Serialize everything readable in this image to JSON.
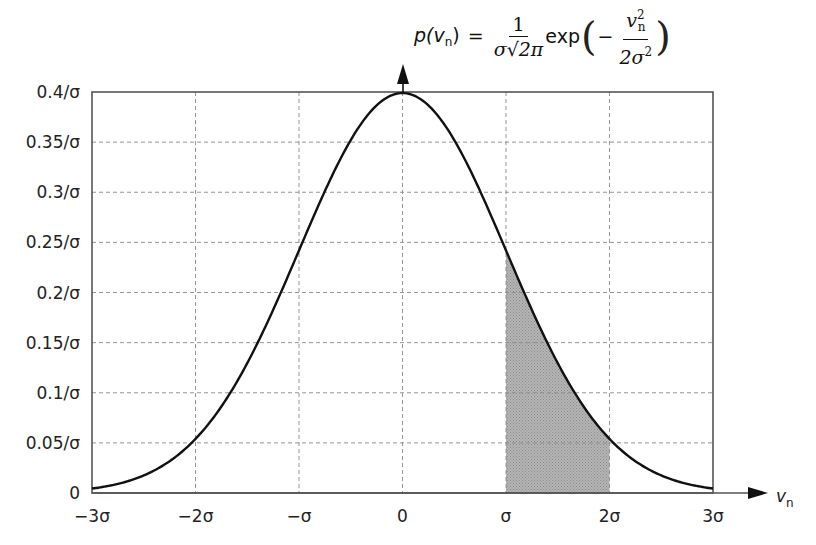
{
  "chart_data": {
    "type": "line",
    "formula": {
      "lhs": "p(v",
      "lhs_sub": "n",
      "lhs_close": ")",
      "equals": "=",
      "frac1_num": "1",
      "frac1_den": "σ√2π",
      "func": "exp",
      "minus": "−",
      "frac2_num": "v",
      "frac2_num_sub": "n",
      "frac2_num_sup": "2",
      "frac2_den": "2σ",
      "frac2_den_sup": "2"
    },
    "xlabel": "v",
    "xlabel_sub": "n",
    "ylabel": "p(v_n)",
    "x_ticks": [
      "−3σ",
      "−2σ",
      "−σ",
      "0",
      "σ",
      "2σ",
      "3σ"
    ],
    "x_tick_values": [
      -3,
      -2,
      -1,
      0,
      1,
      2,
      3
    ],
    "y_ticks": [
      "0",
      "0.05/σ",
      "0.1/σ",
      "0.15/σ",
      "0.2/σ",
      "0.25/σ",
      "0.3/σ",
      "0.35/σ",
      "0.4/σ"
    ],
    "y_tick_values": [
      0,
      0.05,
      0.1,
      0.15,
      0.2,
      0.25,
      0.3,
      0.35,
      0.4
    ],
    "xlim": [
      -3,
      3
    ],
    "ylim": [
      0,
      0.4
    ],
    "grid": true,
    "legend": "none",
    "series": [
      {
        "name": "Gaussian PDF (units of σ)",
        "x": [
          -3,
          -2.5,
          -2,
          -1.5,
          -1,
          -0.5,
          0,
          0.5,
          1,
          1.5,
          2,
          2.5,
          3
        ],
        "y": [
          0.0044,
          0.0175,
          0.054,
          0.1295,
          0.242,
          0.3521,
          0.3989,
          0.3521,
          0.242,
          0.1295,
          0.054,
          0.0175,
          0.0044
        ]
      }
    ],
    "shaded_region": {
      "from": 1,
      "to": 2,
      "label": "area between σ and 2σ",
      "color": "#a8a8a8"
    }
  }
}
